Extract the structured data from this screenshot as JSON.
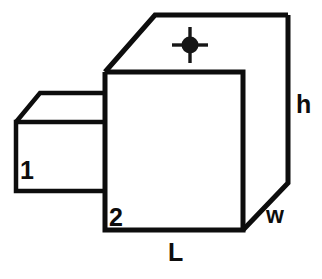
{
  "diagram": {
    "type": "technical-line-drawing",
    "background_color": "#ffffff",
    "line_color": "#0d0d0d",
    "line_width_px": 5,
    "labels": {
      "small_block": "1",
      "main_block": "2",
      "length": "L",
      "width": "w",
      "height": "h"
    },
    "marker": {
      "name": "crosshair-target-marker",
      "face": "top",
      "center_x": 190,
      "center_y": 45,
      "dot_radius": 8,
      "tick_length": 9,
      "color": "#161616"
    },
    "geometry": {
      "main_box": {
        "front_face": "105,72 243,72 243,230 105,230",
        "top_face": "105,72 155,15 288,15 243,72",
        "right_face": "243,72 288,15 288,183 243,230"
      },
      "small_box": {
        "front_face": "16,122 105,122 105,191 16,191",
        "top_face": "16,122 40,93 105,93 105,122"
      }
    }
  }
}
